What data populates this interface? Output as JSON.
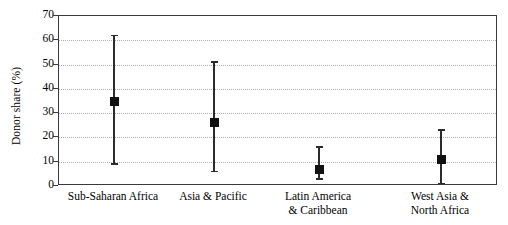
{
  "chart_data": {
    "type": "scatter",
    "title": "",
    "xlabel": "",
    "ylabel": "Donor share (%)",
    "ylim": [
      0,
      70
    ],
    "yticks": [
      0,
      10,
      20,
      30,
      40,
      50,
      60,
      70
    ],
    "grid": true,
    "legend": "none",
    "marker": "filled-square",
    "error_style": "capped-range-bars",
    "categories": [
      "Sub-Saharan Africa",
      "Asia & Pacific",
      "Latin America\n& Caribbean",
      "West Asia &\nNorth Africa"
    ],
    "series": [
      {
        "name": "Donor share",
        "values": [
          35,
          26,
          7,
          11
        ],
        "lower": [
          9,
          6,
          3,
          1
        ],
        "upper": [
          62,
          51,
          16,
          23
        ]
      }
    ],
    "points": [
      {
        "category": "Sub-Saharan Africa",
        "value": 35,
        "lower": 9,
        "upper": 62
      },
      {
        "category": "Asia & Pacific",
        "value": 26,
        "lower": 6,
        "upper": 51
      },
      {
        "category": "Latin America & Caribbean",
        "value": 7,
        "lower": 3,
        "upper": 16
      },
      {
        "category": "West Asia & North Africa",
        "value": 11,
        "lower": 1,
        "upper": 23
      }
    ],
    "colors": {
      "marker": "#111111",
      "errorbar": "#2b2b2b",
      "frame": "#3a3a3a",
      "grid": "#b0b0b0",
      "background": "#ffffff"
    }
  }
}
